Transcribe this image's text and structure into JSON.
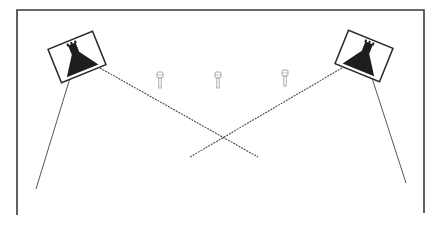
{
  "diagram": {
    "type": "room-layout",
    "colors": {
      "background": "#ffffff",
      "wall": "#3a3a3a",
      "fixture": "#1e1e1e",
      "beam": "#4a4a4a",
      "mic": "#9a9a9a"
    },
    "room": {
      "left": 17,
      "top": 10,
      "right": 424,
      "bottom_left": 215,
      "bottom_right": 213
    },
    "fixtures": [
      {
        "id": "left",
        "cx": 77,
        "cy": 56,
        "angle": -22
      },
      {
        "id": "right",
        "cx": 363,
        "cy": 56,
        "angle": 22
      }
    ],
    "microphones": [
      {
        "id": "mic-1",
        "x": 160,
        "y": 72
      },
      {
        "id": "mic-2",
        "x": 218,
        "y": 72
      },
      {
        "id": "mic-3",
        "x": 285,
        "y": 70
      }
    ],
    "beams": [
      {
        "id": "left-cross",
        "x1": 100,
        "y1": 68,
        "x2": 258,
        "y2": 157,
        "dashed": true
      },
      {
        "id": "right-cross",
        "x1": 342,
        "y1": 68,
        "x2": 190,
        "y2": 157,
        "dashed": true
      },
      {
        "id": "left-down",
        "x1": 70,
        "y1": 78,
        "x2": 36,
        "y2": 189,
        "dashed": false
      },
      {
        "id": "right-down",
        "x1": 372,
        "y1": 78,
        "x2": 406,
        "y2": 183,
        "dashed": false
      }
    ]
  }
}
